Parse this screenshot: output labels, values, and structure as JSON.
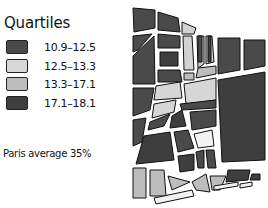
{
  "legend": {
    "title": "Quartiles",
    "items": [
      {
        "label": "10.9–12.5",
        "color": "#4a4a4a"
      },
      {
        "label": "12.5–13.3",
        "color": "#d6d6d6"
      },
      {
        "label": "13.3–17.1",
        "color": "#bdbdbd"
      },
      {
        "label": "17.1–18.1",
        "color": "#3e3e3e"
      }
    ]
  },
  "note": "Paris average 35%",
  "map": {
    "stroke": "#111111",
    "road": "#f2f2f2"
  }
}
